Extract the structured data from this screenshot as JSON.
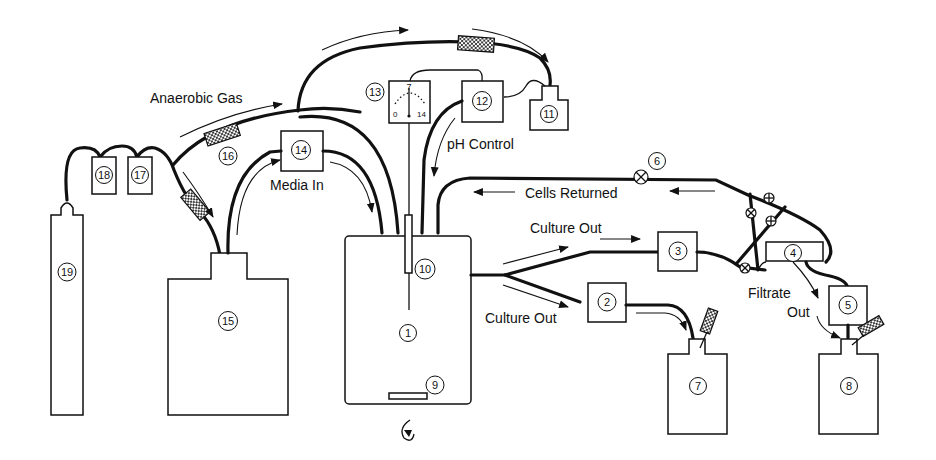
{
  "diagram": {
    "type": "bioreactor-schematic",
    "labels": {
      "anaerobic_gas": "Anaerobic Gas",
      "media_in": "Media In",
      "ph_control": "pH Control",
      "cells_returned": "Cells Returned",
      "culture_out_top": "Culture Out",
      "culture_out_bottom": "Culture Out",
      "filtrate": "Filtrate",
      "out": "Out"
    },
    "components": [
      {
        "id": "1",
        "label": "①"
      },
      {
        "id": "2",
        "label": "②"
      },
      {
        "id": "3",
        "label": "③"
      },
      {
        "id": "4",
        "label": "④"
      },
      {
        "id": "5",
        "label": "⑤"
      },
      {
        "id": "6",
        "label": "⑥"
      },
      {
        "id": "7",
        "label": "⑦"
      },
      {
        "id": "8",
        "label": "⑧"
      },
      {
        "id": "9",
        "label": "⑨"
      },
      {
        "id": "10",
        "label": "⑩"
      },
      {
        "id": "11",
        "label": "⑪"
      },
      {
        "id": "12",
        "label": "⑫"
      },
      {
        "id": "13",
        "label": "⑬"
      },
      {
        "id": "14",
        "label": "⑭"
      },
      {
        "id": "15",
        "label": "⑮"
      },
      {
        "id": "16",
        "label": "⑯"
      },
      {
        "id": "17",
        "label": "⑰"
      },
      {
        "id": "18",
        "label": "⑱"
      },
      {
        "id": "19",
        "label": "⑲"
      }
    ],
    "numbers": {
      "n1": "1",
      "n2": "2",
      "n3": "3",
      "n4": "4",
      "n5": "5",
      "n6": "6",
      "n7": "7",
      "n8": "8",
      "n9": "9",
      "n10": "10",
      "n11": "11",
      "n12": "12",
      "n13": "13",
      "n14": "14",
      "n15": "15",
      "n16": "16",
      "n17": "17",
      "n18": "18",
      "n19": "19"
    },
    "ph_meter": {
      "min": "0",
      "mid": "7",
      "max": "14"
    }
  }
}
